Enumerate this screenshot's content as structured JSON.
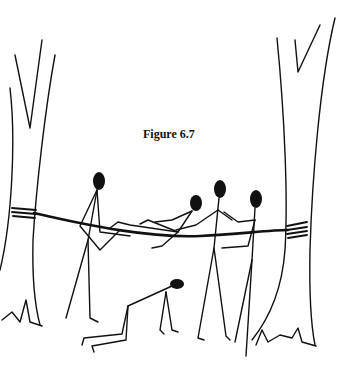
{
  "figure": {
    "caption": "Figure 6.7",
    "elements": {
      "trees": 2,
      "rope": 1,
      "people": 5
    },
    "colors": {
      "ink": "#111111",
      "background": "#ffffff"
    }
  }
}
